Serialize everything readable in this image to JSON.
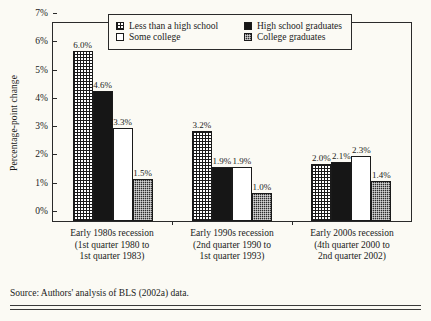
{
  "chart_data": {
    "type": "bar",
    "title": "",
    "xlabel": "",
    "ylabel": "Percentage-point change",
    "ylim": [
      0,
      7
    ],
    "ytick_labels": [
      "0%",
      "1%",
      "2%",
      "3%",
      "4%",
      "5%",
      "6%",
      "7%"
    ],
    "ytick_values": [
      0,
      1,
      2,
      3,
      4,
      5,
      6,
      7
    ],
    "grid": false,
    "legend_position": "inside-top-center",
    "categories": [
      "Early 1980s recession (1st quarter 1980 to 1st quarter 1983)",
      "Early 1990s recession (2nd quarter 1990 to 1st quarter 1993)",
      "Early 2000s recession (4th quarter 2000 to 2nd quarter 2002)"
    ],
    "category_lines": [
      [
        "Early 1980s recession",
        "(1st quarter 1980 to",
        "1st quarter 1983)"
      ],
      [
        "Early 1990s recession",
        "(2nd quarter 1990 to",
        "1st quarter 1993)"
      ],
      [
        "Early 2000s recession",
        "(4th quarter 2000 to",
        "2nd quarter 2002)"
      ]
    ],
    "series": [
      {
        "name": "Less than a high school",
        "pattern": "grid",
        "values": [
          6.0,
          3.2,
          2.0
        ],
        "labels": [
          "6.0%",
          "3.2%",
          "2.0%"
        ]
      },
      {
        "name": "High school graduates",
        "pattern": "solid",
        "values": [
          4.6,
          1.9,
          2.1
        ],
        "labels": [
          "4.6%",
          "1.9%",
          "2.1%"
        ]
      },
      {
        "name": "Some college",
        "pattern": "white",
        "values": [
          3.3,
          1.9,
          2.3
        ],
        "labels": [
          "3.3%",
          "1.9%",
          "2.3%"
        ]
      },
      {
        "name": "College graduates",
        "pattern": "check",
        "values": [
          1.5,
          1.0,
          1.4
        ],
        "labels": [
          "1.5%",
          "1.0%",
          "1.4%"
        ]
      }
    ]
  },
  "legend": {
    "row1": [
      {
        "label": "Less than a high school",
        "pattern": "grid"
      },
      {
        "label": "High school graduates",
        "pattern": "solid"
      }
    ],
    "row2": [
      {
        "label": "Some college",
        "pattern": "white"
      },
      {
        "label": "College graduates",
        "pattern": "check"
      }
    ]
  },
  "source": "Source: Authors' analysis of BLS (2002a) data."
}
